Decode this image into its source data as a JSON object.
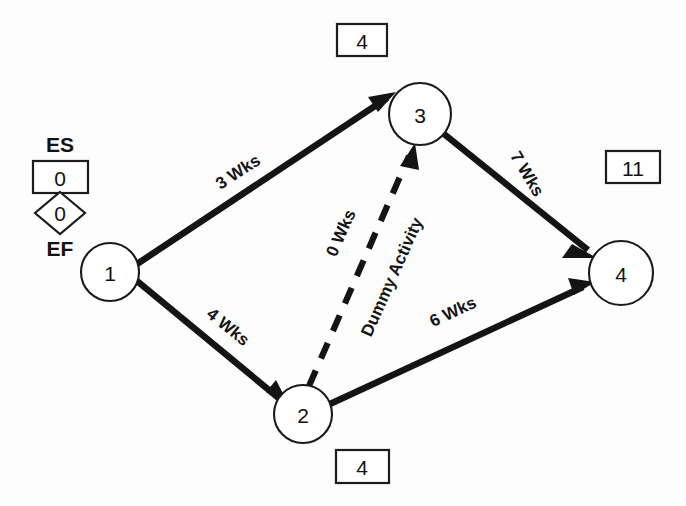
{
  "diagram": {
    "type": "activity-on-arrow-network",
    "title": "",
    "nodes": [
      {
        "id": "1",
        "label": "1",
        "cx": 110,
        "cy": 272,
        "r": 29
      },
      {
        "id": "2",
        "label": "2",
        "cx": 303,
        "cy": 414,
        "r": 29
      },
      {
        "id": "3",
        "label": "3",
        "cx": 420,
        "cy": 114,
        "r": 31
      },
      {
        "id": "4",
        "label": "4",
        "cx": 621,
        "cy": 273,
        "r": 32
      }
    ],
    "edges": [
      {
        "id": "1-3",
        "from": "1",
        "to": "3",
        "label": "3 Wks",
        "style": "solid",
        "label_x": 238,
        "label_y": 172,
        "label_rotate": -33
      },
      {
        "id": "1-2",
        "from": "1",
        "to": "2",
        "label": "4 Wks",
        "style": "solid",
        "label_x": 228,
        "label_y": 327,
        "label_rotate": 37
      },
      {
        "id": "2-3",
        "from": "2",
        "to": "3",
        "label": "0 Wks",
        "style": "dashed",
        "label_x": 339,
        "label_y": 235,
        "label_rotate": -68
      },
      {
        "id": "2-3-name",
        "from": "2",
        "to": "3",
        "label": "Dummy Activity",
        "style": "dashed",
        "label_x": 390,
        "label_y": 280,
        "label_rotate": -68
      },
      {
        "id": "3-4",
        "from": "3",
        "to": "4",
        "label": "7 Wks",
        "style": "solid",
        "label_x": 525,
        "label_y": 172,
        "label_rotate": 57
      },
      {
        "id": "2-4",
        "from": "2",
        "to": "4",
        "label": "6 Wks",
        "style": "solid",
        "label_x": 453,
        "label_y": 313,
        "label_rotate": -32
      }
    ],
    "value_boxes": [
      {
        "id": "node3-es",
        "value": "4",
        "x": 337,
        "y": 24,
        "w": 50,
        "h": 32,
        "for_node": "3"
      },
      {
        "id": "node4-es",
        "value": "11",
        "x": 606,
        "y": 151,
        "w": 54,
        "h": 32,
        "for_node": "4"
      },
      {
        "id": "node2-es",
        "value": "4",
        "x": 336,
        "y": 450,
        "w": 53,
        "h": 33,
        "for_node": "2"
      }
    ],
    "legend": {
      "es_label": "ES",
      "es_value": "0",
      "ef_label": "EF",
      "ef_value": "0",
      "es_box": {
        "x": 33,
        "y": 161,
        "w": 55,
        "h": 32
      },
      "diamond": {
        "cx": 60,
        "cy": 213,
        "rx": 25,
        "ry": 21
      },
      "es_text_x": 60,
      "es_text_y": 144,
      "ef_text_x": 60,
      "ef_text_y": 247
    },
    "colors": {
      "stroke": "#141414",
      "background": "#ffffff",
      "text": "#111111"
    }
  }
}
